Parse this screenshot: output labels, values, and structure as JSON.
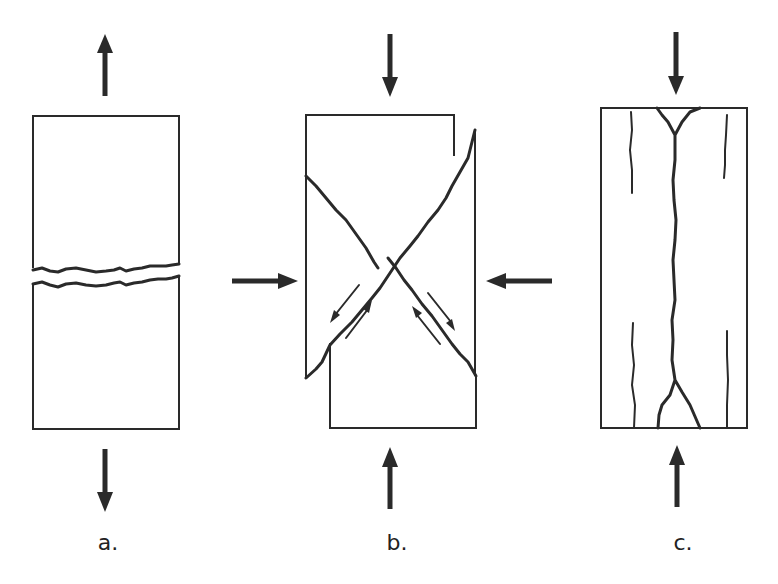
{
  "figure": {
    "panels": [
      {
        "id": "a",
        "label": "a.",
        "mode": "tension",
        "description": "Tensile fracture perpendicular to pull axis",
        "label_x": 108,
        "label_y": 548
      },
      {
        "id": "b",
        "label": "b.",
        "mode": "compression-shear",
        "description": "Conjugate shear fractures under compression with shear-sense arrows",
        "label_x": 397,
        "label_y": 548
      },
      {
        "id": "c",
        "label": "c.",
        "mode": "axial-splitting",
        "description": "Longitudinal splitting cracks under axial compression",
        "label_x": 683,
        "label_y": 548
      }
    ],
    "colors": {
      "stroke": "#2a2a2a",
      "background": "#ffffff"
    }
  }
}
